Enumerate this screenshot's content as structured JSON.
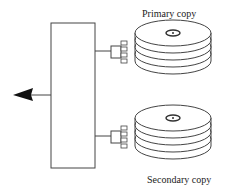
{
  "diagram": {
    "labels": {
      "primary": "Primary copy",
      "secondary": "Secondary copy"
    },
    "components": [
      {
        "id": "controller",
        "type": "box"
      },
      {
        "id": "output-arrow",
        "type": "arrow",
        "direction": "left"
      },
      {
        "id": "primary-disk-stack",
        "type": "disk-stack",
        "platters": 4,
        "label": "Primary copy"
      },
      {
        "id": "secondary-disk-stack",
        "type": "disk-stack",
        "platters": 4,
        "label": "Secondary copy"
      }
    ],
    "colors": {
      "stroke": "#333333",
      "fill": "#ffffff",
      "arrow": "#111111"
    }
  }
}
